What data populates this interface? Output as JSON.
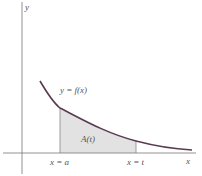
{
  "figure": {
    "axes": {
      "x_label": "x",
      "y_label": "y"
    },
    "curve_label": "y = f(x)",
    "area_label": "A(t)",
    "tick_labels": {
      "left": "x = a",
      "right": "x = t"
    },
    "colors": {
      "curve": "#5a3a52",
      "shade": "#e2e2e2",
      "axis": "#777777",
      "text": "#555555"
    }
  }
}
